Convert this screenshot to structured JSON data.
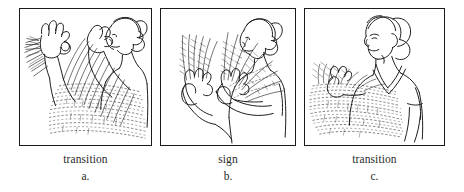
{
  "figure": {
    "name": "sign-language-motion-phases",
    "panel_count": 3,
    "ink_color": "#1a1a1a",
    "text_color": "#2b2b2b",
    "background_color": "#ffffff",
    "border_color": "#1a1a1a"
  },
  "panels": [
    {
      "id": "a",
      "phase_label": "transition",
      "letter_label": "a.",
      "alt": "Line drawing of a signer: left hand raised in an O/OK handshape with motion-trail hatching, right hand near the face, head in profile turned to the right; dense sweeping motion streaks fill the lower area."
    },
    {
      "id": "b",
      "phase_label": "sign",
      "letter_label": "b.",
      "alt": "Line drawing of the signer with both hands raised in front of the chest forming the sign, with fan-shaped feathered motion trails radiating upward from both hands; head in profile facing right."
    },
    {
      "id": "c",
      "phase_label": "transition",
      "letter_label": "c.",
      "alt": "Line drawing of the signer with hands lowered to the left, head and torso upright facing left; broad horizontal sweeping motion trails across the lower half."
    }
  ],
  "captions": {
    "a_phase": "transition",
    "a_letter": "a.",
    "b_phase": "sign",
    "b_letter": "b.",
    "c_phase": "transition",
    "c_letter": "c."
  }
}
